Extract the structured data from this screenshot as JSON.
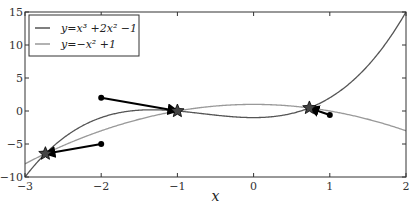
{
  "chart_data": {
    "type": "line",
    "title": "",
    "xlabel": "x",
    "ylabel": "",
    "xlim": [
      -3,
      2
    ],
    "ylim": [
      -10,
      15
    ],
    "xticks": [
      -3,
      -2,
      -1,
      0,
      1,
      2
    ],
    "yticks": [
      -10,
      -5,
      0,
      5,
      10,
      15
    ],
    "xtick_labels": [
      "−3",
      "−2",
      "−1",
      "0",
      "1",
      "2"
    ],
    "ytick_labels": [
      "−10",
      "−5",
      "0",
      "5",
      "10",
      "15"
    ],
    "grid": false,
    "legend_position": "upper left",
    "series": [
      {
        "name": "y = x^3 + 2x^2 - 1",
        "legend_label": "y=x³ +2x² −1",
        "color": "#555555",
        "expr": "cubic"
      },
      {
        "name": "y = -x^2 + 1",
        "legend_label": "y=−x² +1",
        "color": "#999999",
        "expr": "parabola"
      }
    ],
    "intersections": [
      {
        "x": -2.732,
        "y": -6.464
      },
      {
        "x": -1.0,
        "y": 0.0
      },
      {
        "x": 0.732,
        "y": 0.464
      }
    ],
    "arrows": [
      {
        "from": [
          -2.0,
          2.0
        ],
        "to": [
          -1.0,
          0.0
        ]
      },
      {
        "from": [
          -2.0,
          -5.0
        ],
        "to": [
          -2.732,
          -6.464
        ]
      },
      {
        "from": [
          1.0,
          -0.6
        ],
        "to": [
          0.732,
          0.464
        ]
      }
    ]
  }
}
